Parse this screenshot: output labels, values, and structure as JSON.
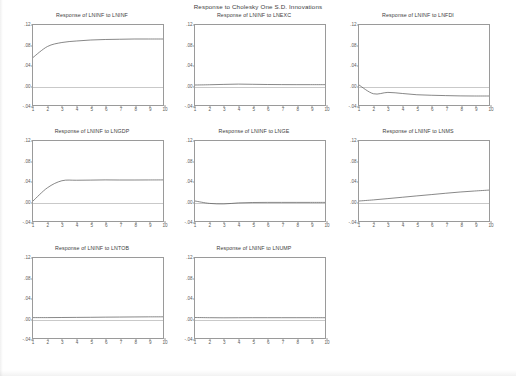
{
  "figure": {
    "title": "Response to Cholesky One S.D. Innovations",
    "rows": 3,
    "columns": 3,
    "panel_count": 8
  },
  "axis": {
    "yticks": [
      ".12",
      ".08",
      ".04",
      ".00",
      "-.04"
    ],
    "ytick_values": [
      0.12,
      0.08,
      0.04,
      0.0,
      -0.04
    ],
    "xticks": [
      "1",
      "2",
      "3",
      "4",
      "5",
      "6",
      "7",
      "8",
      "9",
      "10"
    ],
    "ylim": [
      -0.04,
      0.12
    ],
    "xlim": [
      1,
      10
    ],
    "line_color": "#555555",
    "axis_color": "#9a9a9a",
    "zero_line_color": "#c9c9c9"
  },
  "chart_data": {
    "type": "line",
    "title": "Response to Cholesky One S.D. Innovations",
    "xlabel": "",
    "ylabel": "",
    "x": [
      1,
      2,
      3,
      4,
      5,
      6,
      7,
      8,
      9,
      10
    ],
    "ylim": [
      -0.04,
      0.12
    ],
    "xlim": [
      1,
      10
    ],
    "grid": false,
    "legend": "none",
    "ytick_labels": [
      ".12",
      ".08",
      ".04",
      ".00",
      "-.04"
    ],
    "xtick_labels": [
      "1",
      "2",
      "3",
      "4",
      "5",
      "6",
      "7",
      "8",
      "9",
      "10"
    ],
    "panels": [
      {
        "title": "Response of LNINF to LNINF",
        "impulse": "LNINF",
        "response": "LNINF",
        "values": [
          0.055,
          0.077,
          0.085,
          0.088,
          0.09,
          0.091,
          0.0915,
          0.092,
          0.092,
          0.092
        ]
      },
      {
        "title": "Response of LNINF to LNEXC",
        "impulse": "LNEXC",
        "response": "LNINF",
        "values": [
          0.0,
          0.0005,
          0.0012,
          0.0018,
          0.0014,
          0.001,
          0.0008,
          0.0007,
          0.0007,
          0.0007
        ]
      },
      {
        "title": "Response of LNINF to LNFDI",
        "impulse": "LNFDI",
        "response": "LNINF",
        "values": [
          0.0,
          -0.0175,
          -0.0148,
          -0.017,
          -0.0195,
          -0.0205,
          -0.0212,
          -0.0218,
          -0.022,
          -0.022
        ]
      },
      {
        "title": "Response of LNINF to LNGDP",
        "impulse": "LNGDP",
        "response": "LNINF",
        "values": [
          0.0,
          0.0265,
          0.0405,
          0.0415,
          0.0418,
          0.0422,
          0.042,
          0.042,
          0.0421,
          0.0422
        ]
      },
      {
        "title": "Response of LNINF to LNGE",
        "impulse": "LNGE",
        "response": "LNINF",
        "values": [
          0.0,
          -0.0048,
          -0.0058,
          -0.0038,
          -0.003,
          -0.0028,
          -0.0028,
          -0.0028,
          -0.0028,
          -0.0028
        ]
      },
      {
        "title": "Response of LNINF to LNMS",
        "impulse": "LNMS",
        "response": "LNINF",
        "values": [
          0.0,
          0.0022,
          0.0048,
          0.0075,
          0.0102,
          0.0128,
          0.0155,
          0.018,
          0.02,
          0.0218
        ]
      },
      {
        "title": "Response of LNINF to LNTOB",
        "impulse": "LNTOB",
        "response": "LNINF",
        "values": [
          0.0008,
          0.0008,
          0.001,
          0.0012,
          0.0014,
          0.0017,
          0.0019,
          0.0021,
          0.0023,
          0.0024
        ]
      },
      {
        "title": "Response of LNINF to LNUMP",
        "impulse": "LNUMP",
        "response": "LNINF",
        "values": [
          0.001,
          0.0006,
          0.0004,
          0.0005,
          0.0006,
          0.0006,
          0.0006,
          0.0006,
          0.0006,
          0.0006
        ]
      }
    ]
  }
}
